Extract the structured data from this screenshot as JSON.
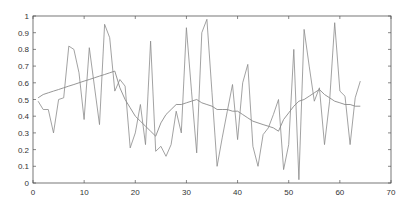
{
  "chart_data": {
    "type": "line",
    "title": "",
    "xlabel": "",
    "ylabel": "",
    "xlim": [
      0,
      70
    ],
    "ylim": [
      0,
      1
    ],
    "grid": false,
    "legend": null,
    "x_ticks": [
      "0",
      "10",
      "20",
      "30",
      "40",
      "50",
      "60",
      "70"
    ],
    "y_ticks": [
      "0",
      "0.1",
      "0.2",
      "0.3",
      "0.4",
      "0.5",
      "0.6",
      "0.7",
      "0.8",
      "0.9",
      "1"
    ],
    "x": [
      1,
      2,
      3,
      4,
      5,
      6,
      7,
      8,
      9,
      10,
      11,
      12,
      13,
      14,
      15,
      16,
      17,
      18,
      19,
      20,
      21,
      22,
      23,
      24,
      25,
      26,
      27,
      28,
      29,
      30,
      31,
      32,
      33,
      34,
      35,
      36,
      37,
      38,
      39,
      40,
      41,
      42,
      43,
      44,
      45,
      46,
      47,
      48,
      49,
      50,
      51,
      52,
      53,
      54,
      55,
      56,
      57,
      58,
      59,
      60,
      61,
      62,
      63,
      64
    ],
    "series": [
      {
        "name": "raw",
        "values": [
          0.49,
          0.44,
          0.44,
          0.3,
          0.5,
          0.51,
          0.82,
          0.8,
          0.66,
          0.38,
          0.81,
          0.58,
          0.35,
          0.95,
          0.87,
          0.55,
          0.62,
          0.58,
          0.21,
          0.3,
          0.47,
          0.23,
          0.85,
          0.19,
          0.22,
          0.16,
          0.23,
          0.43,
          0.3,
          0.93,
          0.55,
          0.18,
          0.9,
          0.98,
          0.54,
          0.1,
          0.27,
          0.43,
          0.59,
          0.26,
          0.6,
          0.71,
          0.22,
          0.1,
          0.29,
          0.33,
          0.41,
          0.5,
          0.08,
          0.23,
          0.8,
          0.02,
          0.92,
          0.7,
          0.49,
          0.57,
          0.23,
          0.49,
          0.96,
          0.55,
          0.52,
          0.23,
          0.51,
          0.61
        ]
      },
      {
        "name": "smoothed",
        "values": [
          0.51,
          0.53,
          0.54,
          0.55,
          0.56,
          0.57,
          0.58,
          0.59,
          0.6,
          0.61,
          0.62,
          0.63,
          0.64,
          0.65,
          0.66,
          0.67,
          0.57,
          0.5,
          0.45,
          0.4,
          0.37,
          0.34,
          0.31,
          0.28,
          0.36,
          0.41,
          0.44,
          0.47,
          0.47,
          0.48,
          0.49,
          0.5,
          0.48,
          0.47,
          0.46,
          0.44,
          0.44,
          0.44,
          0.43,
          0.43,
          0.41,
          0.39,
          0.37,
          0.36,
          0.35,
          0.34,
          0.33,
          0.31,
          0.38,
          0.42,
          0.46,
          0.49,
          0.5,
          0.52,
          0.54,
          0.56,
          0.53,
          0.51,
          0.49,
          0.48,
          0.47,
          0.47,
          0.46,
          0.46
        ]
      }
    ]
  },
  "style": {
    "line_color": "#8a8a8a",
    "axis_color": "#555555",
    "text_color": "#333333"
  }
}
